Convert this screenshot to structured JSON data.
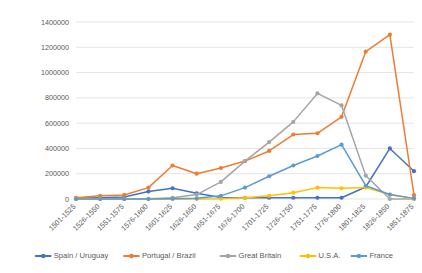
{
  "chart_data": {
    "type": "line",
    "title": "",
    "xlabel": "",
    "ylabel": "",
    "ylim": [
      0,
      1400000
    ],
    "ytick_values": [
      0,
      200000,
      400000,
      600000,
      800000,
      1000000,
      1200000,
      1400000
    ],
    "ytick_labels": [
      "0",
      "200000",
      "400000",
      "600000",
      "800000",
      "1000000",
      "1200000",
      "1400000"
    ],
    "grid": true,
    "legend_position": "bottom",
    "categories": [
      "1501-1525",
      "1526-1550",
      "1551-1575",
      "1576-1600",
      "1601-1625",
      "1626-1650",
      "1651-1675",
      "1676-1700",
      "1701-1725",
      "1726-1750",
      "1751-1775",
      "1776-1800",
      "1801-1825",
      "1826-1850",
      "1851-1875"
    ],
    "series": [
      {
        "name": "Spain / Uruguay",
        "color": "#4472C4",
        "values": [
          6000,
          10000,
          15000,
          60000,
          85000,
          45000,
          12000,
          10000,
          10000,
          10000,
          10000,
          10000,
          95000,
          400000,
          220000
        ]
      },
      {
        "name": "Portugal / Brazil",
        "color": "#ED7D31",
        "values": [
          10000,
          25000,
          32000,
          90000,
          265000,
          200000,
          245000,
          300000,
          380000,
          510000,
          520000,
          650000,
          1165000,
          1300000,
          30000
        ]
      },
      {
        "name": "Great Britain",
        "color": "#A5A5A5",
        "values": [
          0,
          0,
          0,
          2000,
          10000,
          35000,
          135000,
          300000,
          450000,
          610000,
          835000,
          740000,
          185000,
          0,
          0
        ]
      },
      {
        "name": "U.S.A.",
        "color": "#FFC000",
        "values": [
          0,
          0,
          0,
          0,
          0,
          0,
          2000,
          10000,
          25000,
          50000,
          90000,
          85000,
          90000,
          35000,
          2000
        ]
      },
      {
        "name": "France",
        "color": "#5B9BD5",
        "values": [
          0,
          0,
          0,
          0,
          2000,
          5000,
          25000,
          90000,
          180000,
          265000,
          340000,
          430000,
          105000,
          35000,
          5000
        ]
      }
    ]
  }
}
